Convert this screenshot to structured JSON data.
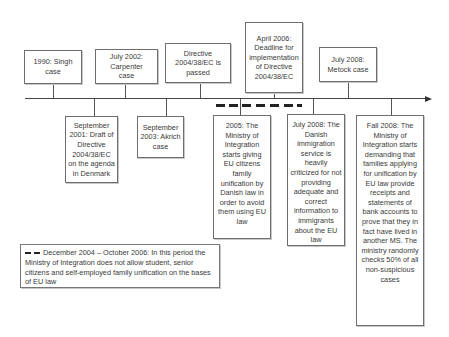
{
  "timeline": {
    "above_events": [
      {
        "id": "singh",
        "label": "1990: Singh case"
      },
      {
        "id": "carpenter",
        "label": "July 2002: Carpenter case"
      },
      {
        "id": "directive-passed",
        "label": "Directive 2004/38/EC is passed"
      },
      {
        "id": "deadline",
        "label": "April 2006: Deadline for implementation of Directive 2004/38/EC"
      },
      {
        "id": "metock",
        "label": "July 2008: Metock case"
      }
    ],
    "below_events": [
      {
        "id": "draft",
        "label": "September 2001: Draft of Directive 2004/38/EC on the agenda in Denmark"
      },
      {
        "id": "akrich",
        "label": "September 2003: Akrich case"
      },
      {
        "id": "ministry-2005",
        "label": "2005: The Ministry of Integration starts giving EU citizens family unification by Danish law in order to avoid them using EU law"
      },
      {
        "id": "criticized",
        "label": "July 2008: The Danish immigration service is heavily criticized for not providing adequate and correct information to immigrants about the EU law"
      },
      {
        "id": "fall-2008",
        "label": "Fall 2008: The Ministry of Integration starts demanding that families applying for unification by EU law provide receipts and statements of bank accounts to prove that they in fact have lived in another MS. The ministry randomly checks 50% of all non-suspicious cases"
      }
    ]
  },
  "legend": {
    "text": "December 2004 – October 2006: In this period the Ministry of Integration does not allow student, senior citizens and self-employed family unification on the bases of EU law"
  }
}
